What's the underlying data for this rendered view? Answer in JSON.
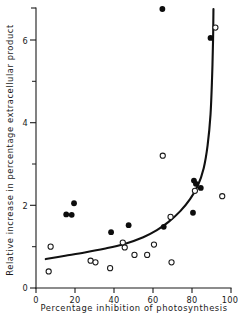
{
  "chart_data": {
    "type": "scatter",
    "title": "",
    "xlabel": "Percentage inhibition of photosynthesis",
    "ylabel": "Relative increase in percentage extracellular product",
    "xlim": [
      0,
      100
    ],
    "ylim": [
      0,
      6.8
    ],
    "xticks": [
      0,
      20,
      40,
      60,
      80,
      100
    ],
    "xtick_labels": [
      "0",
      "20",
      "40",
      "60",
      "80",
      "100"
    ],
    "yticks": [
      0,
      2,
      4,
      6
    ],
    "ytick_labels": [
      "0",
      "2",
      "4",
      "6"
    ],
    "yticks_minor": [
      1,
      3,
      5
    ],
    "grid": false,
    "legend_position": "none",
    "series": [
      {
        "name": "filled-circles",
        "marker": "filled-circle",
        "color": "#0d0d0d",
        "points": [
          [
            15.5,
            1.78
          ],
          [
            18.3,
            1.77
          ],
          [
            19.5,
            2.05
          ],
          [
            38.5,
            1.35
          ],
          [
            47.5,
            1.52
          ],
          [
            64.8,
            6.75
          ],
          [
            65.5,
            1.48
          ],
          [
            80.5,
            1.82
          ],
          [
            81.0,
            2.6
          ],
          [
            82.0,
            2.52
          ],
          [
            84.5,
            2.42
          ],
          [
            89.5,
            6.05
          ]
        ]
      },
      {
        "name": "open-circles",
        "marker": "open-circle",
        "color": "#1a1a1a",
        "points": [
          [
            7.5,
            1.0
          ],
          [
            6.5,
            0.4
          ],
          [
            28.0,
            0.66
          ],
          [
            30.5,
            0.62
          ],
          [
            38.0,
            0.48
          ],
          [
            44.5,
            1.1
          ],
          [
            45.5,
            0.98
          ],
          [
            50.5,
            0.8
          ],
          [
            57.0,
            0.8
          ],
          [
            60.5,
            1.05
          ],
          [
            65.0,
            3.2
          ],
          [
            69.5,
            0.62
          ],
          [
            69.0,
            1.72
          ],
          [
            81.5,
            2.35
          ],
          [
            95.5,
            2.22
          ],
          [
            92.0,
            6.3
          ]
        ]
      }
    ],
    "fitted_curve": {
      "name": "fitted-curve",
      "description": "monotonic rising curve with near-vertical asymptote at ~91% inhibition",
      "points": [
        [
          5.0,
          0.7
        ],
        [
          15.0,
          0.78
        ],
        [
          25.0,
          0.86
        ],
        [
          35.0,
          0.95
        ],
        [
          45.0,
          1.06
        ],
        [
          55.0,
          1.23
        ],
        [
          62.0,
          1.4
        ],
        [
          68.0,
          1.6
        ],
        [
          74.0,
          1.86
        ],
        [
          79.0,
          2.15
        ],
        [
          83.0,
          2.48
        ],
        [
          86.0,
          2.9
        ],
        [
          88.0,
          3.45
        ],
        [
          89.5,
          4.2
        ],
        [
          90.3,
          5.1
        ],
        [
          90.8,
          6.0
        ],
        [
          91.0,
          6.75
        ]
      ]
    }
  }
}
